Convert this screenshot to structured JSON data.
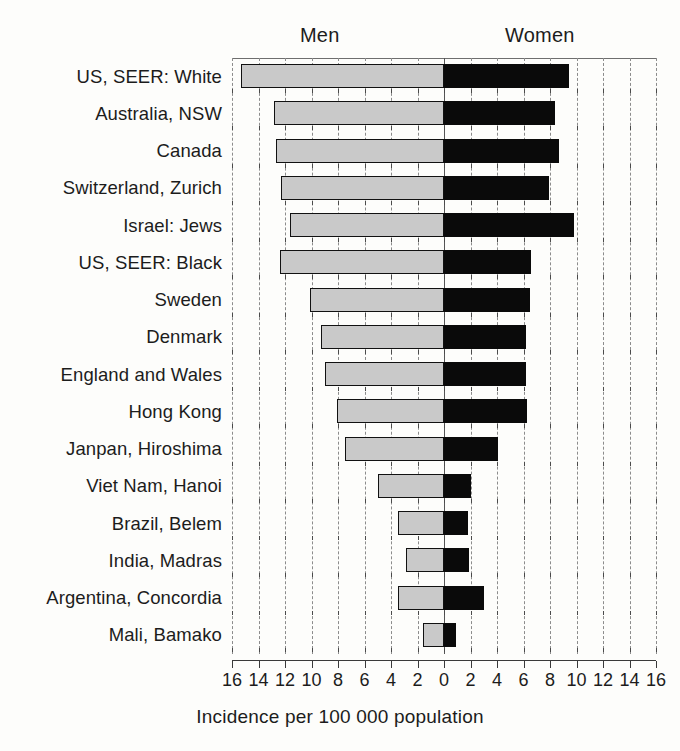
{
  "header": {
    "men_label": "Men",
    "women_label": "Women"
  },
  "axis": {
    "title": "Incidence per 100 000 population",
    "tick_labels": [
      "16",
      "14",
      "12",
      "10",
      "8",
      "6",
      "4",
      "2",
      "0",
      "2",
      "4",
      "6",
      "8",
      "10",
      "12",
      "14",
      "16"
    ],
    "max": 16,
    "step": 2
  },
  "colors": {
    "men_bar": "#c9c9c9",
    "women_bar": "#0a0a0a",
    "bar_outline": "#111111",
    "gridline": "#8c8c8c",
    "axis": "#3a3a3a",
    "background": "#fdfdfb",
    "text": "#1c1c1c"
  },
  "chart_data": {
    "type": "bar",
    "orientation": "horizontal-diverging",
    "title": "",
    "subtitle": "",
    "xlabel": "Incidence per 100 000 population",
    "ylabel": "",
    "xlim": [
      -16,
      16
    ],
    "xtick_step": 2,
    "grid": true,
    "legend_position": "top",
    "categories": [
      "US, SEER:  White",
      "Australia, NSW",
      "Canada",
      "Switzerland, Zurich",
      "Israel: Jews",
      "US, SEER: Black",
      "Sweden",
      "Denmark",
      "England and Wales",
      "Hong Kong",
      "Janpan, Hiroshima",
      "Viet Nam, Hanoi",
      "Brazil, Belem",
      "India, Madras",
      "Argentina, Concordia",
      "Mali, Bamako"
    ],
    "series": [
      {
        "name": "Men",
        "direction": "left",
        "color": "#c9c9c9",
        "values": [
          15.3,
          12.8,
          12.7,
          12.3,
          11.6,
          12.4,
          10.1,
          9.3,
          9.0,
          8.1,
          7.5,
          5.0,
          3.5,
          2.9,
          3.5,
          1.6
        ]
      },
      {
        "name": "Women",
        "direction": "right",
        "color": "#0a0a0a",
        "values": [
          9.4,
          8.4,
          8.7,
          7.9,
          9.8,
          6.6,
          6.5,
          6.2,
          6.2,
          6.3,
          4.1,
          2.0,
          1.8,
          1.9,
          3.0,
          0.9
        ]
      }
    ]
  }
}
